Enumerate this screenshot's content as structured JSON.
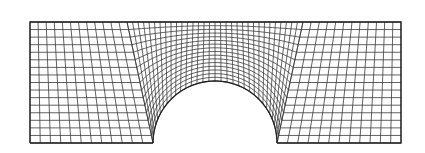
{
  "diagram": {
    "type": "structured-quad-mesh",
    "canvas": {
      "width": 425,
      "height": 153,
      "background": "#ffffff"
    },
    "colors": {
      "line": "#3a3a3a",
      "boundary": "#222222"
    },
    "outline": {
      "left": 30,
      "right": 401,
      "top": 22,
      "bottom": 143
    },
    "notch": {
      "center_x": 215,
      "center_y": 143,
      "radius": 62
    },
    "blocks": {
      "left": {
        "top_left": [
          30,
          22
        ],
        "top_right": [
          127,
          22
        ],
        "bottom_left": [
          30,
          143
        ],
        "bottom_right": [
          153,
          143
        ],
        "columns": 12,
        "rows": 16
      },
      "right": {
        "top_left": [
          303,
          22
        ],
        "top_right": [
          401,
          22
        ],
        "bottom_left": [
          277,
          143
        ],
        "bottom_right": [
          401,
          143
        ],
        "columns": 12,
        "rows": 16
      },
      "center": {
        "top_from_x": 127,
        "top_to_x": 303,
        "top_y": 22,
        "radial_divisions": 32,
        "ring_divisions": 16
      }
    }
  }
}
